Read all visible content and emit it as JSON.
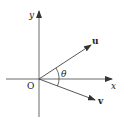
{
  "diagram": {
    "type": "vector-angle",
    "axes": {
      "x_label": "x",
      "y_label": "y",
      "origin_label": "O"
    },
    "vectors": [
      {
        "name": "u",
        "label": "u"
      },
      {
        "name": "v",
        "label": "v"
      }
    ],
    "angle_label": "θ",
    "colors": {
      "stroke": "#333333",
      "background": "#ffffff"
    }
  }
}
